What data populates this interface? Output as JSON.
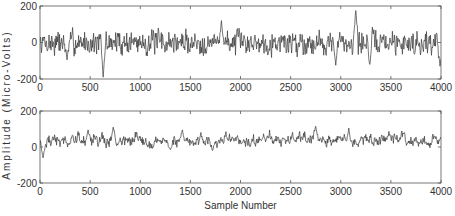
{
  "chart_data": [
    {
      "type": "line",
      "id": "top",
      "title": "",
      "xlabel": "",
      "ylabel": "Amplitude (Micro-Volts)",
      "xlim": [
        0,
        4000
      ],
      "ylim": [
        -200,
        200
      ],
      "x_ticks": [
        0,
        500,
        1000,
        1500,
        2000,
        2500,
        3000,
        3500,
        4000
      ],
      "y_ticks": [
        200,
        0,
        -200
      ],
      "grid": false,
      "series": [
        {
          "name": "EEG signal 1",
          "color": "#3a3a3a",
          "description": "Noisy oscillation around 0 with amplitude ~±100 µV",
          "baseline": 0,
          "noise_amplitude": 55,
          "smoothness": 0.35,
          "seed": 7,
          "events": [
            {
              "x": 630,
              "y": -190
            },
            {
              "x": 270,
              "y": -95
            },
            {
              "x": 1810,
              "y": 120
            },
            {
              "x": 3150,
              "y": 175
            },
            {
              "x": 2950,
              "y": -125
            },
            {
              "x": 3990,
              "y": -130
            },
            {
              "x": 3290,
              "y": -120
            }
          ]
        }
      ]
    },
    {
      "type": "line",
      "id": "bottom",
      "title": "",
      "xlabel": "Sample Number",
      "ylabel": "Amplitude (Micro-Volts)",
      "xlim": [
        0,
        4000
      ],
      "ylim": [
        -200,
        200
      ],
      "x_ticks": [
        0,
        500,
        1000,
        1500,
        2000,
        2500,
        3000,
        3500,
        4000
      ],
      "y_ticks": [
        200,
        0,
        -200
      ],
      "grid": false,
      "series": [
        {
          "name": "EEG signal 2",
          "color": "#3a3a3a",
          "description": "Smoother oscillation with positive baseline ~+35 µV",
          "baseline": 35,
          "noise_amplitude": 30,
          "smoothness": 0.75,
          "seed": 19,
          "events": [
            {
              "x": 30,
              "y": -60
            },
            {
              "x": 730,
              "y": 110
            },
            {
              "x": 480,
              "y": 95
            },
            {
              "x": 1420,
              "y": 95
            },
            {
              "x": 2750,
              "y": 115
            },
            {
              "x": 3080,
              "y": 105
            },
            {
              "x": 1300,
              "y": -15
            },
            {
              "x": 1720,
              "y": -20
            }
          ]
        }
      ]
    }
  ],
  "layout": {
    "plots": [
      {
        "x0": 40,
        "y0": 6,
        "x1": 441,
        "y1": 79
      },
      {
        "x0": 40,
        "y0": 111,
        "x1": 441,
        "y1": 183
      }
    ],
    "shared_ylabel_center_y": 105,
    "xlabel_y": 209
  }
}
